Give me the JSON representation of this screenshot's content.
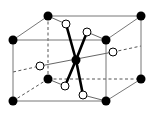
{
  "diagram": {
    "title": "",
    "colors": {
      "background": "#ffffff",
      "filled_atom": "#000000",
      "open_atom_fill": "#ffffff",
      "open_atom_stroke": "#000000",
      "edge": "#777777",
      "bond": "#000000"
    },
    "cube": {
      "front": [
        [
          13,
          40
        ],
        [
          106,
          40
        ],
        [
          106,
          101
        ],
        [
          13,
          101
        ]
      ],
      "back": [
        [
          48,
          16
        ],
        [
          141,
          16
        ],
        [
          141,
          79
        ],
        [
          48,
          79
        ]
      ]
    },
    "filled_atoms": [
      {
        "id": "corner-front-top-left",
        "x": 13,
        "y": 40
      },
      {
        "id": "corner-front-top-right",
        "x": 106,
        "y": 40
      },
      {
        "id": "corner-front-bottom-right",
        "x": 106,
        "y": 101
      },
      {
        "id": "corner-front-bottom-left",
        "x": 13,
        "y": 101
      },
      {
        "id": "corner-back-top-left",
        "x": 48,
        "y": 16
      },
      {
        "id": "corner-back-top-right",
        "x": 141,
        "y": 16
      },
      {
        "id": "corner-back-bottom-right",
        "x": 141,
        "y": 79
      },
      {
        "id": "corner-back-bottom-left",
        "x": 48,
        "y": 79
      },
      {
        "id": "center",
        "x": 76,
        "y": 60
      }
    ],
    "open_atoms": [
      {
        "id": "upper-back",
        "x": 66,
        "y": 24
      },
      {
        "id": "upper-front",
        "x": 87,
        "y": 32
      },
      {
        "id": "right",
        "x": 113,
        "y": 52
      },
      {
        "id": "left",
        "x": 40,
        "y": 66
      },
      {
        "id": "lower-back",
        "x": 65,
        "y": 86
      },
      {
        "id": "lower-front",
        "x": 83,
        "y": 95
      }
    ]
  }
}
